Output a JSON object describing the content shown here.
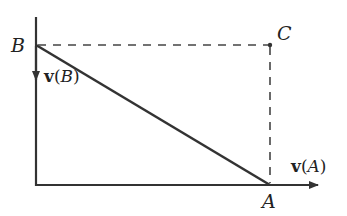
{
  "diagram": {
    "points": {
      "A": {
        "label": "A",
        "x": 270,
        "y": 185
      },
      "B": {
        "label": "B",
        "x": 36,
        "y": 45
      },
      "C": {
        "label": "C",
        "x": 270,
        "y": 45
      }
    },
    "vectors": {
      "vB": {
        "symbol": "v",
        "open": "(",
        "arg": "B",
        "close": ")"
      },
      "vA": {
        "symbol": "v",
        "open": "(",
        "arg": "A",
        "close": ")"
      }
    },
    "colors": {
      "line": "#333333",
      "dashed": "#444444"
    }
  }
}
